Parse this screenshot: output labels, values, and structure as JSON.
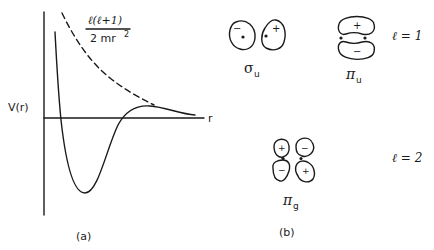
{
  "panel_a": {
    "caption": "(a)",
    "y_label": "V(r)",
    "x_label": "r",
    "centrifugal_term": {
      "numerator": "ℓ(ℓ+1)",
      "denominator": "2 mr",
      "exponent": "2"
    },
    "curves": [
      {
        "name": "centrifugal barrier",
        "style": "dashed"
      },
      {
        "name": "effective potential",
        "style": "solid"
      }
    ]
  },
  "panel_b": {
    "caption": "(b)",
    "rows": [
      {
        "l_label": "ℓ = 1",
        "orbitals": [
          {
            "symbol": "σ",
            "subscript": "u",
            "lobe_signs": [
              "−",
              "+"
            ]
          },
          {
            "symbol": "π",
            "subscript": "u",
            "lobe_signs": [
              "+",
              "−"
            ]
          }
        ]
      },
      {
        "l_label": "ℓ = 2",
        "orbitals": [
          {
            "symbol": "π",
            "subscript": "g",
            "lobe_signs": [
              "+",
              "−",
              "−",
              "+"
            ]
          }
        ]
      }
    ]
  }
}
